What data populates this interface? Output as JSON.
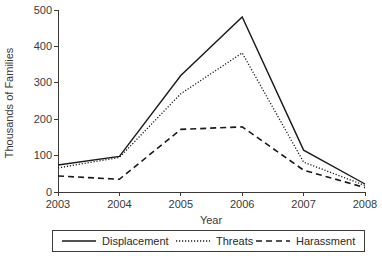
{
  "chart_data": {
    "type": "line",
    "title": "",
    "xlabel": "Year",
    "ylabel": "Thousands of Families",
    "x": [
      2003,
      2004,
      2005,
      2006,
      2007,
      2008
    ],
    "xticklabels": [
      "2003",
      "2004",
      "2005",
      "2006",
      "2007",
      "2008"
    ],
    "yticklabels": [
      "0",
      "100",
      "200",
      "300",
      "400",
      "500"
    ],
    "yticks": [
      0,
      100,
      200,
      300,
      400,
      500
    ],
    "ylim": [
      0,
      500
    ],
    "xlim": [
      2003,
      2008
    ],
    "grid": false,
    "legend_position": "below-axes",
    "series": [
      {
        "name": "Displacement",
        "style": "solid",
        "values": [
          74,
          98,
          320,
          481,
          115,
          22
        ]
      },
      {
        "name": "Threats",
        "style": "dotted",
        "values": [
          66,
          95,
          270,
          382,
          82,
          18
        ]
      },
      {
        "name": "Harassment",
        "style": "dashed",
        "values": [
          44,
          35,
          172,
          179,
          60,
          12
        ]
      }
    ]
  },
  "legend": {
    "items": [
      {
        "label": "Displacement",
        "style": "solid"
      },
      {
        "label": "Threats",
        "style": "dotted"
      },
      {
        "label": "Harassment",
        "style": "dashed"
      }
    ]
  },
  "colors": {
    "axis": "#3a3a3a",
    "line": "#1a1a1a",
    "background": "#ffffff"
  }
}
